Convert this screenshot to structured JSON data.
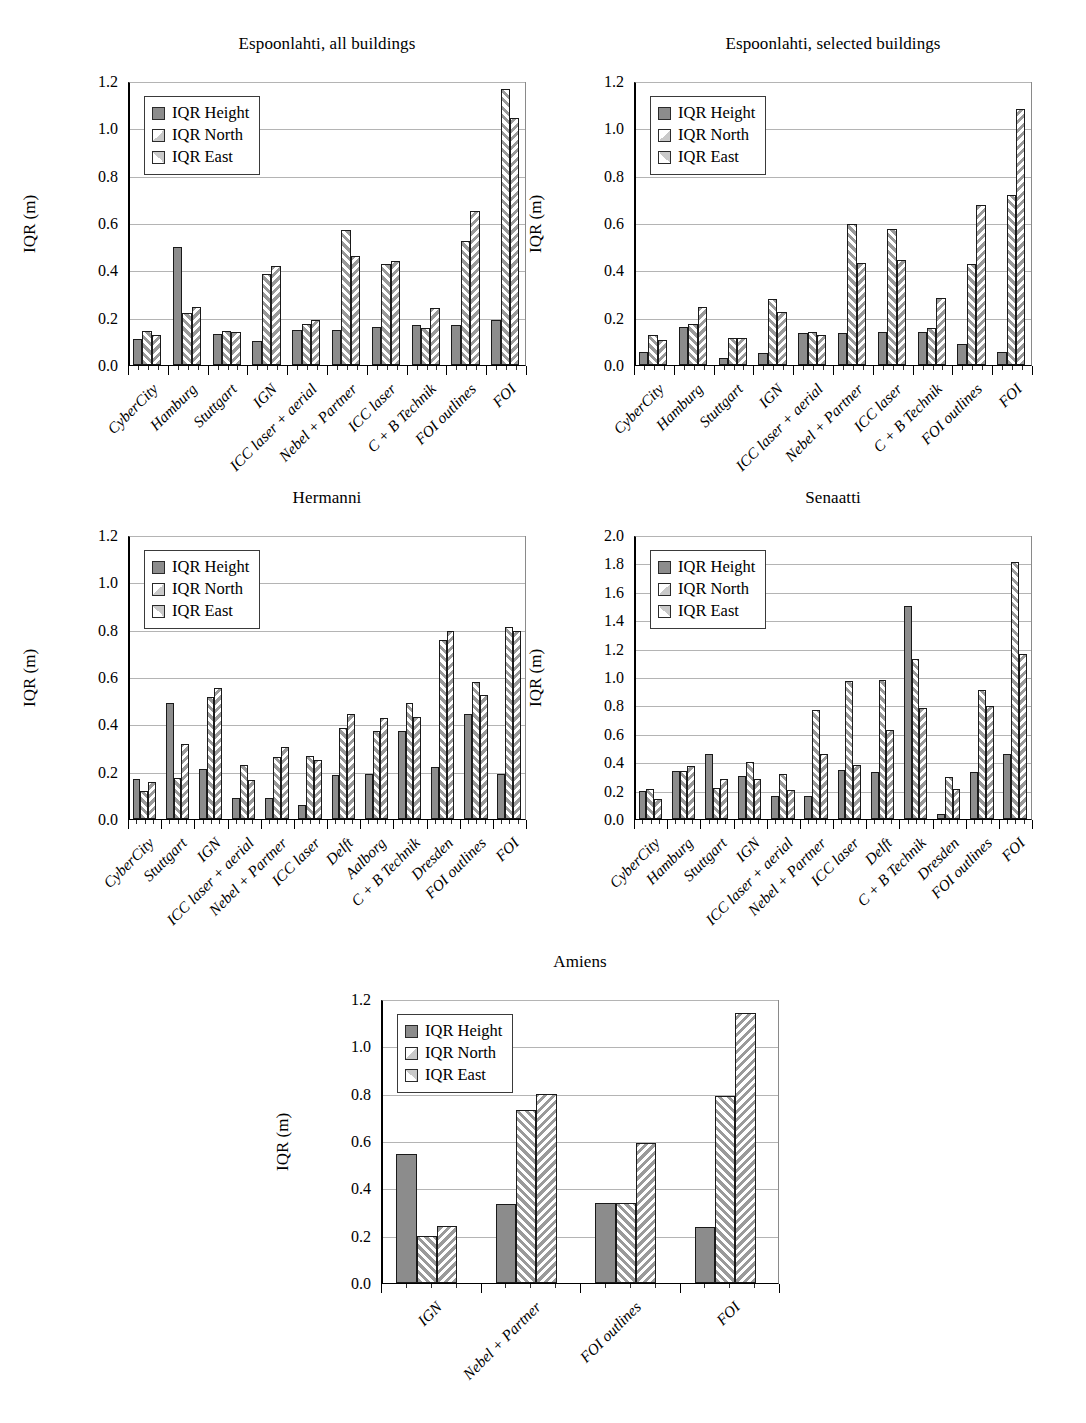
{
  "figure": {
    "ylabel": "IQR (m)",
    "series_names": [
      "IQR Height",
      "IQR North",
      "IQR East"
    ],
    "colors": {
      "height": "#8c8c8c",
      "north": "#ffffff",
      "east": "#ffffff",
      "outline": "#1a1a1a",
      "grid": "#b4b4b4"
    }
  },
  "chart_data": [
    {
      "type": "bar",
      "title": "Espoonlahti, all buildings",
      "xlabel": "",
      "ylabel": "IQR (m)",
      "ylim": [
        0.0,
        1.2
      ],
      "yticks": [
        0.0,
        0.2,
        0.4,
        0.6,
        0.8,
        1.0,
        1.2
      ],
      "ytick_labels": [
        "0.0",
        "0.2",
        "0.4",
        "0.6",
        "0.8",
        "1.0",
        "1.2"
      ],
      "grid": true,
      "legend": [
        "IQR Height",
        "IQR North",
        "IQR East"
      ],
      "legend_position": "upper left",
      "categories": [
        "CyberCity",
        "Hamburg",
        "Stuttgart",
        "IGN",
        "ICC laser + aerial",
        "Nebel + Partner",
        "ICC laser",
        "C + B Technik",
        "FOI outlines",
        "FOI"
      ],
      "series": [
        {
          "name": "IQR Height",
          "values": [
            0.11,
            0.5,
            0.13,
            0.1,
            0.15,
            0.15,
            0.16,
            0.17,
            0.17,
            0.19
          ]
        },
        {
          "name": "IQR North",
          "values": [
            0.145,
            0.22,
            0.145,
            0.385,
            0.175,
            0.57,
            0.425,
            0.155,
            0.525,
            1.165
          ]
        },
        {
          "name": "IQR East",
          "values": [
            0.125,
            0.245,
            0.14,
            0.42,
            0.19,
            0.46,
            0.44,
            0.24,
            0.65,
            1.045
          ]
        }
      ]
    },
    {
      "type": "bar",
      "title": "Espoonlahti, selected buildings",
      "xlabel": "",
      "ylabel": "IQR (m)",
      "ylim": [
        0.0,
        1.2
      ],
      "yticks": [
        0.0,
        0.2,
        0.4,
        0.6,
        0.8,
        1.0,
        1.2
      ],
      "ytick_labels": [
        "0.0",
        "0.2",
        "0.4",
        "0.6",
        "0.8",
        "1.0",
        "1.2"
      ],
      "grid": true,
      "legend": [
        "IQR Height",
        "IQR North",
        "IQR East"
      ],
      "legend_position": "upper left",
      "categories": [
        "CyberCity",
        "Hamburg",
        "Stuttgart",
        "IGN",
        "ICC laser + aerial",
        "Nebel + Partner",
        "ICC laser",
        "C + B Technik",
        "FOI outlines",
        "FOI"
      ],
      "series": [
        {
          "name": "IQR Height",
          "values": [
            0.055,
            0.16,
            0.03,
            0.05,
            0.135,
            0.135,
            0.14,
            0.14,
            0.09,
            0.055
          ]
        },
        {
          "name": "IQR North",
          "values": [
            0.125,
            0.175,
            0.115,
            0.28,
            0.14,
            0.595,
            0.575,
            0.155,
            0.425,
            0.72
          ]
        },
        {
          "name": "IQR East",
          "values": [
            0.105,
            0.245,
            0.115,
            0.225,
            0.125,
            0.43,
            0.445,
            0.285,
            0.675,
            1.08
          ]
        }
      ]
    },
    {
      "type": "bar",
      "title": "Hermanni",
      "xlabel": "",
      "ylabel": "IQR (m)",
      "ylim": [
        0.0,
        1.2
      ],
      "yticks": [
        0.0,
        0.2,
        0.4,
        0.6,
        0.8,
        1.0,
        1.2
      ],
      "ytick_labels": [
        "0.0",
        "0.2",
        "0.4",
        "0.6",
        "0.8",
        "1.0",
        "1.2"
      ],
      "grid": true,
      "legend": [
        "IQR Height",
        "IQR North",
        "IQR East"
      ],
      "legend_position": "upper left",
      "categories": [
        "CyberCity",
        "Stuttgart",
        "IGN",
        "ICC laser + aerial",
        "Nebel + Partner",
        "ICC laser",
        "Delft",
        "Aalborg",
        "C + B Technik",
        "Dresden",
        "FOI outlines",
        "FOI"
      ],
      "series": [
        {
          "name": "IQR Height",
          "values": [
            0.17,
            0.49,
            0.21,
            0.09,
            0.09,
            0.06,
            0.185,
            0.19,
            0.37,
            0.22,
            0.445,
            0.19
          ]
        },
        {
          "name": "IQR North",
          "values": [
            0.12,
            0.175,
            0.515,
            0.23,
            0.26,
            0.265,
            0.385,
            0.37,
            0.49,
            0.755,
            0.58,
            0.81
          ]
        },
        {
          "name": "IQR East",
          "values": [
            0.155,
            0.315,
            0.555,
            0.165,
            0.305,
            0.25,
            0.445,
            0.425,
            0.43,
            0.795,
            0.525,
            0.795
          ]
        }
      ]
    },
    {
      "type": "bar",
      "title": "Senaatti",
      "xlabel": "",
      "ylabel": "IQR (m)",
      "ylim": [
        0.0,
        2.0
      ],
      "yticks": [
        0.0,
        0.2,
        0.4,
        0.6,
        0.8,
        1.0,
        1.2,
        1.4,
        1.6,
        1.8,
        2.0
      ],
      "ytick_labels": [
        "0.0",
        "0.2",
        "0.4",
        "0.6",
        "0.8",
        "1.0",
        "1.2",
        "1.4",
        "1.6",
        "1.8",
        "2.0"
      ],
      "grid": true,
      "legend": [
        "IQR Height",
        "IQR North",
        "IQR East"
      ],
      "legend_position": "upper left",
      "categories": [
        "CyberCity",
        "Hamburg",
        "Stuttgart",
        "IGN",
        "ICC laser + aerial",
        "Nebel + Partner",
        "ICC laser",
        "Delft",
        "C + B Technik",
        "Dresden",
        "FOI outlines",
        "FOI"
      ],
      "series": [
        {
          "name": "IQR Height",
          "values": [
            0.2,
            0.34,
            0.46,
            0.3,
            0.16,
            0.16,
            0.345,
            0.33,
            1.5,
            0.035,
            0.33,
            0.455
          ]
        },
        {
          "name": "IQR North",
          "values": [
            0.21,
            0.34,
            0.22,
            0.405,
            0.32,
            0.77,
            0.97,
            0.98,
            1.125,
            0.295,
            0.91,
            1.81
          ]
        },
        {
          "name": "IQR East",
          "values": [
            0.14,
            0.37,
            0.285,
            0.285,
            0.205,
            0.46,
            0.38,
            0.625,
            0.78,
            0.21,
            0.795,
            1.165
          ]
        }
      ]
    },
    {
      "type": "bar",
      "title": "Amiens",
      "xlabel": "",
      "ylabel": "IQR (m)",
      "ylim": [
        0.0,
        1.2
      ],
      "yticks": [
        0.0,
        0.2,
        0.4,
        0.6,
        0.8,
        1.0,
        1.2
      ],
      "ytick_labels": [
        "0.0",
        "0.2",
        "0.4",
        "0.6",
        "0.8",
        "1.0",
        "1.2"
      ],
      "grid": true,
      "legend": [
        "IQR Height",
        "IQR North",
        "IQR East"
      ],
      "legend_position": "upper left",
      "categories": [
        "IGN",
        "Nebel + Partner",
        "FOI outlines",
        "FOI"
      ],
      "series": [
        {
          "name": "IQR Height",
          "values": [
            0.545,
            0.335,
            0.34,
            0.235
          ]
        },
        {
          "name": "IQR North",
          "values": [
            0.2,
            0.73,
            0.34,
            0.79
          ]
        },
        {
          "name": "IQR East",
          "values": [
            0.24,
            0.8,
            0.59,
            1.14
          ]
        }
      ]
    }
  ]
}
